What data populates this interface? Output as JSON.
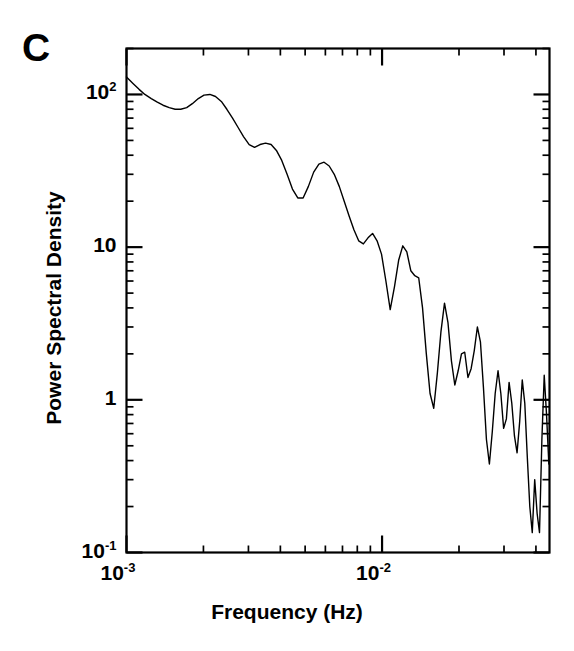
{
  "figure": {
    "panel_label": "C",
    "background_color": "#ffffff",
    "line_color": "#000000",
    "axis_color": "#000000"
  },
  "axes": {
    "x_title": "Frequency (Hz)",
    "y_title": "Power Spectral Density",
    "x_tick_labels": [
      {
        "mantissa": "10",
        "exponent": "-3",
        "value": 0.001
      },
      {
        "mantissa": "10",
        "exponent": "-2",
        "value": 0.01
      }
    ],
    "y_tick_labels": [
      {
        "mantissa": "10",
        "exponent": "2",
        "value": 100
      },
      {
        "mantissa": "10",
        "exponent": "",
        "value": 10
      },
      {
        "mantissa": "1",
        "exponent": "",
        "value": 1
      },
      {
        "mantissa": "10",
        "exponent": "-1",
        "value": 0.1
      }
    ]
  },
  "chart_data": {
    "type": "line",
    "title": "",
    "subtitle": "",
    "panel": "C",
    "xlabel": "Frequency (Hz)",
    "ylabel": "Power Spectral Density",
    "xscale": "log",
    "yscale": "log",
    "xlim": [
      0.001,
      0.0452
    ],
    "ylim": [
      0.1,
      200
    ],
    "grid": false,
    "legend": null,
    "legend_position": "none",
    "annotations": [
      {
        "text": "C",
        "position": "top-left-outside"
      }
    ],
    "x_major_ticks": [
      0.001,
      0.01
    ],
    "x_minor_ticks": [
      0.002,
      0.003,
      0.004,
      0.005,
      0.006,
      0.007,
      0.008,
      0.009,
      0.02,
      0.03,
      0.04
    ],
    "y_major_ticks": [
      0.1,
      1,
      10,
      100
    ],
    "y_minor_ticks": [
      0.2,
      0.3,
      0.4,
      0.5,
      0.6,
      0.7,
      0.8,
      0.9,
      2,
      3,
      4,
      5,
      6,
      7,
      8,
      9,
      20,
      30,
      40,
      50,
      60,
      70,
      80,
      90,
      200
    ],
    "series": [
      {
        "name": "Power spectral density",
        "color": "#000000",
        "linewidth": 1.4,
        "x": [
          0.001,
          0.00106,
          0.00112,
          0.00118,
          0.00125,
          0.00132,
          0.00139,
          0.00147,
          0.00155,
          0.00163,
          0.00172,
          0.00181,
          0.00191,
          0.00201,
          0.00212,
          0.00223,
          0.00235,
          0.00247,
          0.0026,
          0.00273,
          0.00287,
          0.00302,
          0.00317,
          0.00333,
          0.0035,
          0.00368,
          0.00386,
          0.00405,
          0.00425,
          0.00446,
          0.00468,
          0.00491,
          0.00515,
          0.0054,
          0.00566,
          0.00593,
          0.00621,
          0.0065,
          0.0068,
          0.00711,
          0.00743,
          0.00776,
          0.0081,
          0.00845,
          0.00881,
          0.00918,
          0.00956,
          0.00995,
          0.01035,
          0.01076,
          0.01118,
          0.01161,
          0.01205,
          0.0125,
          0.01296,
          0.01343,
          0.01391,
          0.0144,
          0.0149,
          0.01541,
          0.01593,
          0.01646,
          0.017,
          0.01755,
          0.01811,
          0.01868,
          0.01926,
          0.01985,
          0.02045,
          0.02106,
          0.02168,
          0.02231,
          0.02295,
          0.0236,
          0.02426,
          0.02493,
          0.02561,
          0.0263,
          0.027,
          0.02771,
          0.02843,
          0.02916,
          0.0299,
          0.03065,
          0.03141,
          0.03218,
          0.03296,
          0.03375,
          0.03455,
          0.03536,
          0.03618,
          0.03701,
          0.03785,
          0.0387,
          0.03956,
          0.04043,
          0.04131,
          0.0422,
          0.0431,
          0.04401,
          0.04493
        ],
        "y": [
          130,
          118,
          108,
          100,
          94,
          89,
          85,
          82,
          80,
          80,
          82,
          87,
          94,
          99,
          100,
          97,
          90,
          80,
          70,
          61,
          53,
          47,
          45,
          47,
          48,
          47,
          43,
          37,
          30,
          24,
          21,
          21,
          25,
          31,
          35,
          36,
          34,
          30,
          25,
          20,
          16,
          13,
          11,
          10.5,
          11.5,
          12.3,
          11.0,
          9.0,
          6.0,
          3.9,
          5.5,
          8.2,
          10.2,
          9.3,
          7.0,
          6.5,
          6.3,
          4.0,
          2.0,
          1.1,
          0.88,
          1.5,
          2.8,
          4.3,
          3.2,
          1.8,
          1.25,
          1.55,
          2.0,
          2.05,
          1.4,
          1.6,
          2.1,
          3.0,
          2.4,
          1.2,
          0.55,
          0.38,
          0.62,
          1.1,
          1.55,
          1.1,
          0.65,
          0.75,
          1.3,
          0.95,
          0.58,
          0.45,
          0.72,
          1.35,
          0.95,
          0.42,
          0.2,
          0.135,
          0.3,
          0.18,
          0.135,
          0.55,
          1.45,
          0.8,
          0.38
        ]
      }
    ]
  }
}
